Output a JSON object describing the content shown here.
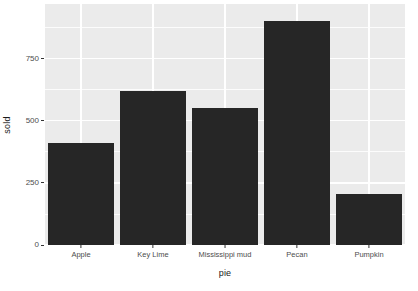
{
  "chart_data": {
    "type": "bar",
    "title": "",
    "xlabel": "pie",
    "ylabel": "sold",
    "categories": [
      "Apple",
      "Key Lime",
      "Mississippi mud",
      "Pecan",
      "Pumpkin"
    ],
    "values": [
      410,
      620,
      550,
      900,
      205
    ],
    "ylim": [
      0,
      970
    ],
    "ytick_values": [
      0,
      250,
      500,
      750
    ],
    "ytick_labels": [
      "0",
      "250",
      "500",
      "750"
    ],
    "yminor_values": [
      125,
      375,
      625,
      875
    ],
    "grid": true,
    "legend": "none",
    "colors": {
      "bar_fill": "#262626",
      "panel_background": "#ebebeb",
      "grid_line": "#ffffff",
      "axis_text": "#4d4d4d",
      "title_text": "#1a1a1a",
      "page_background": "#ffffff"
    }
  },
  "axes": {
    "y_title": "sold",
    "x_title": "pie",
    "y_ticks": [
      {
        "label": "750",
        "value": 750
      },
      {
        "label": "500",
        "value": 500
      },
      {
        "label": "250",
        "value": 250
      },
      {
        "label": "0",
        "value": 0
      }
    ],
    "x_ticks": [
      {
        "label": "Apple",
        "lines": [
          "Apple"
        ]
      },
      {
        "label": "Key Lime",
        "lines": [
          "Key Lime"
        ]
      },
      {
        "label": "Mississippi mud",
        "lines": [
          "Mississippi mud"
        ]
      },
      {
        "label": "Pecan",
        "lines": [
          "Pecan"
        ]
      },
      {
        "label": "Pumpkin",
        "lines": [
          "Pumpkin"
        ]
      }
    ]
  }
}
